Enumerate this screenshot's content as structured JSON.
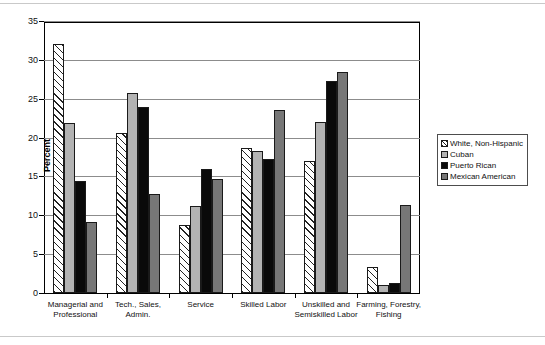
{
  "chart_data": {
    "type": "bar",
    "title": "",
    "xlabel": "",
    "ylabel": "Percent",
    "ylim": [
      0,
      35
    ],
    "yticks": [
      0,
      5,
      10,
      15,
      20,
      25,
      30,
      35
    ],
    "grid": true,
    "legend_position": "right",
    "categories": [
      "Managerial and Professional",
      "Tech., Sales, Admin.",
      "Service",
      "Skilled Labor",
      "Unskilled and Semiskilled Labor",
      "Farming, Forestry, Fishing"
    ],
    "category_lines": [
      [
        "Managerial and",
        "Professional"
      ],
      [
        "Tech., Sales,",
        "Admin."
      ],
      [
        "Service",
        ""
      ],
      [
        "Skilled Labor",
        ""
      ],
      [
        "Unskilled and",
        "Semiskilled Labor"
      ],
      [
        "Farming, Forestry,",
        "Fishing"
      ]
    ],
    "series": [
      {
        "name": "White, Non-Hispanic",
        "pattern": "diagonal-hatch",
        "color": "#ffffff",
        "values": [
          32.0,
          20.6,
          8.8,
          18.6,
          17.0,
          3.3
        ]
      },
      {
        "name": "Cuban",
        "pattern": "solid",
        "color": "#b3b3b3",
        "values": [
          21.9,
          25.8,
          11.2,
          18.3,
          22.0,
          1.0
        ]
      },
      {
        "name": "Puerto Rican",
        "pattern": "solid",
        "color": "#0a0a0a",
        "values": [
          14.4,
          24.0,
          16.0,
          17.3,
          27.3,
          1.3
        ]
      },
      {
        "name": "Mexican American",
        "pattern": "solid",
        "color": "#777777",
        "values": [
          9.2,
          12.7,
          14.7,
          23.6,
          28.5,
          11.3
        ]
      }
    ]
  },
  "legend": {
    "items": [
      {
        "label": "White, Non-Hispanic"
      },
      {
        "label": "Cuban"
      },
      {
        "label": "Puerto Rican"
      },
      {
        "label": "Mexican American"
      }
    ]
  }
}
